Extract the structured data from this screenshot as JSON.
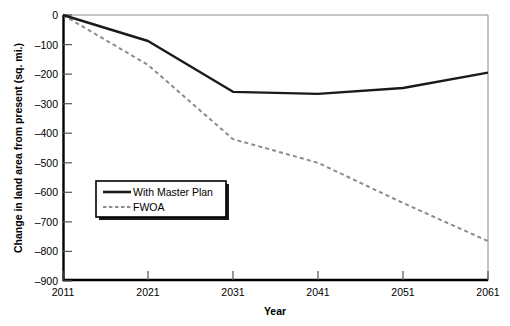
{
  "chart_data": {
    "type": "line",
    "title": "",
    "xlabel": "Year",
    "ylabel": "Change in land area from present (sq. mi.)",
    "x": [
      2011,
      2021,
      2031,
      2041,
      2051,
      2061
    ],
    "categories": [
      "2011",
      "2021",
      "2031",
      "2041",
      "2051",
      "2061"
    ],
    "xlim": [
      2011,
      2061
    ],
    "ylim": [
      -900,
      0
    ],
    "xticks": [
      "2011",
      "2021",
      "2031",
      "2041",
      "2051",
      "2061"
    ],
    "yticks": [
      "0",
      "–100",
      "–200",
      "–300",
      "–400",
      "–500",
      "–600",
      "–700",
      "–800",
      "–900"
    ],
    "ytick_values": [
      0,
      -100,
      -200,
      -300,
      -400,
      -500,
      -600,
      -700,
      -800,
      -900
    ],
    "grid": false,
    "legend_position": "lower left",
    "series": [
      {
        "name": "With Master Plan",
        "style": "solid",
        "color": "#1a1a1a",
        "values": [
          0,
          -88,
          -260,
          -267,
          -247,
          -195
        ]
      },
      {
        "name": "FWOA",
        "style": "dotted",
        "color": "#8c8c8c",
        "values": [
          0,
          -169,
          -420,
          -500,
          -636,
          -765
        ]
      }
    ]
  },
  "legend": {
    "items": [
      {
        "label": "With Master Plan",
        "style": "solid"
      },
      {
        "label": "FWOA",
        "style": "dotted"
      }
    ]
  },
  "axes": {
    "x_title": "Year",
    "y_title": "Change in land area from present (sq. mi.)"
  },
  "colors": {
    "master_plan_line": "#1a1a1a",
    "fwoa_line": "#8c8c8c",
    "axis": "#000000",
    "background": "#ffffff",
    "plot_border": "#7a7a7a",
    "legend_shadow": "#000000"
  }
}
